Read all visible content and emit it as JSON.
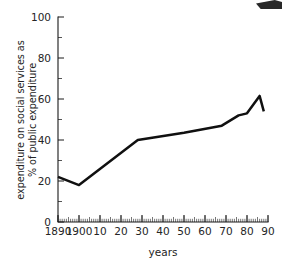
{
  "chart_data": {
    "type": "line",
    "title": "",
    "xlabel": "years",
    "ylabel": "expenditure on social services as % of public expenditure",
    "ylabel_line1": "expenditure on social services as",
    "ylabel_line2": "% of public expenditure",
    "xlim": [
      1890,
      1990
    ],
    "ylim": [
      0,
      100
    ],
    "grid": false,
    "legend": false,
    "y_ticks": [
      0,
      20,
      40,
      60,
      80,
      100
    ],
    "y_tick_labels": [
      "0",
      "20",
      "40",
      "60",
      "80",
      "100"
    ],
    "y_minor_ticks": [
      10,
      30,
      50,
      70,
      90
    ],
    "x_ticks": [
      1890,
      1900,
      1910,
      1920,
      1930,
      1940,
      1950,
      1960,
      1970,
      1980,
      1990
    ],
    "x_tick_labels": [
      "1890",
      "1900",
      "10",
      "20",
      "30",
      "40",
      "50",
      "60",
      "70",
      "80",
      "90"
    ],
    "x": [
      1890,
      1900,
      1928,
      1950,
      1968,
      1976,
      1980,
      1986,
      1988
    ],
    "values": [
      22,
      18,
      40,
      43.5,
      47,
      52,
      53,
      61.5,
      54
    ],
    "series": [
      {
        "name": "expenditure on social services as % of public expenditure",
        "x": [
          1890,
          1900,
          1928,
          1950,
          1968,
          1976,
          1980,
          1986,
          1988
        ],
        "values": [
          22,
          18,
          40,
          43.5,
          47,
          52,
          53,
          61.5,
          54
        ]
      }
    ],
    "annotations": []
  }
}
